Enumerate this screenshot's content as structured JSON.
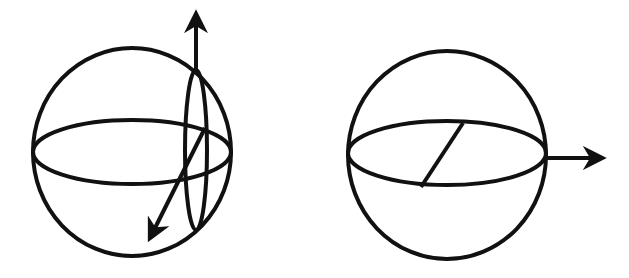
{
  "diagram": {
    "stroke_color": "#111111",
    "background": "#ffffff",
    "figures": [
      {
        "name": "left-sphere",
        "sphere": {
          "cx": 132,
          "cy": 152,
          "rx": 99,
          "ry": 104
        },
        "equator": {
          "cx": 132,
          "cy": 152,
          "rx": 99,
          "ry": 32
        },
        "meridian": {
          "cx": 196,
          "cy": 150,
          "rx": 11,
          "ry": 80
        },
        "arrows": [
          {
            "name": "vertical-axis-arrow",
            "x1": 196,
            "y1": 72,
            "x2": 196,
            "y2": 14
          },
          {
            "name": "diagonal-axis-arrow",
            "x1": 205,
            "y1": 128,
            "x2": 150,
            "y2": 238
          }
        ]
      },
      {
        "name": "right-sphere",
        "sphere": {
          "cx": 447,
          "cy": 155,
          "rx": 99,
          "ry": 104
        },
        "equator": {
          "cx": 447,
          "cy": 153,
          "rx": 99,
          "ry": 32
        },
        "radius_line": {
          "x1": 463,
          "y1": 123,
          "x2": 421,
          "y2": 187
        },
        "arrows": [
          {
            "name": "horizontal-axis-arrow",
            "x1": 546,
            "y1": 158,
            "x2": 602,
            "y2": 158
          }
        ]
      }
    ]
  }
}
